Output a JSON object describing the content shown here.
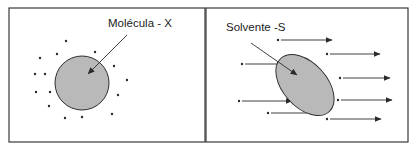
{
  "left_panel": {
    "label": "Molécula - X",
    "label_pos": [
      108,
      27
    ],
    "frame": {
      "x": 9,
      "y": 8,
      "w": 196,
      "h": 134
    },
    "molecule": {
      "cx": 82,
      "cy": 83,
      "r": 27
    },
    "pointer": {
      "from": [
        127,
        35
      ],
      "to": [
        88,
        74
      ]
    },
    "solvent_dots": [
      [
        66,
        41
      ],
      [
        40,
        58
      ],
      [
        57,
        54
      ],
      [
        95,
        52
      ],
      [
        114,
        66
      ],
      [
        35,
        74
      ],
      [
        45,
        74
      ],
      [
        127,
        80
      ],
      [
        36,
        92
      ],
      [
        50,
        92
      ],
      [
        118,
        95
      ],
      [
        49,
        106
      ],
      [
        65,
        118
      ],
      [
        82,
        117
      ],
      [
        112,
        114
      ]
    ]
  },
  "right_panel": {
    "label": "Solvente -S",
    "label_pos": [
      226,
      31
    ],
    "frame": {
      "x": 206,
      "y": 8,
      "w": 202,
      "h": 134
    },
    "molecule": {
      "cx": 305,
      "cy": 85,
      "rx": 22,
      "ry": 36,
      "rotate": -42
    },
    "pointer": {
      "from": [
        251,
        43
      ],
      "to": [
        297,
        75
      ]
    },
    "flow_arrows": [
      {
        "from": [
          278,
          40
        ],
        "to": [
          332,
          40
        ]
      },
      {
        "from": [
          327,
          54
        ],
        "to": [
          380,
          54
        ]
      },
      {
        "from": [
          242,
          64
        ],
        "to": [
          295,
          64
        ]
      },
      {
        "from": [
          340,
          78
        ],
        "to": [
          390,
          78
        ]
      },
      {
        "from": [
          239,
          101
        ],
        "to": [
          292,
          101
        ]
      },
      {
        "from": [
          338,
          100
        ],
        "to": [
          392,
          100
        ]
      },
      {
        "from": [
          268,
          113
        ],
        "to": [
          322,
          113
        ]
      },
      {
        "from": [
          327,
          119
        ],
        "to": [
          381,
          119
        ]
      }
    ]
  }
}
